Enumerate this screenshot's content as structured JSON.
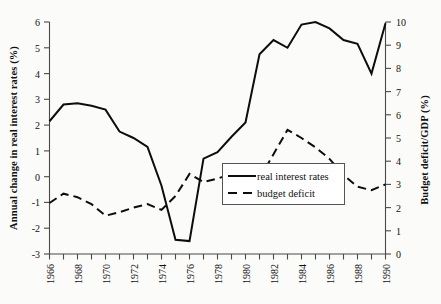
{
  "chart_data": {
    "type": "line",
    "title": "",
    "xlabel": "",
    "ylabel": "Annual change in real interest rates (%)",
    "y2label": "Budget deficit/GDP (%)",
    "grid": false,
    "legend_position": "center-right",
    "xlim": [
      1966,
      1990
    ],
    "ylim": [
      -3,
      6
    ],
    "y2lim": [
      0,
      10
    ],
    "x": [
      1966,
      1967,
      1968,
      1969,
      1970,
      1971,
      1972,
      1973,
      1974,
      1975,
      1976,
      1977,
      1978,
      1979,
      1980,
      1981,
      1982,
      1983,
      1984,
      1985,
      1986,
      1987,
      1988,
      1989,
      1990
    ],
    "xtick_labels": [
      "1966",
      "1968",
      "1970",
      "1972",
      "1974",
      "1976",
      "1978",
      "1980",
      "1982",
      "1984",
      "1986",
      "1988",
      "1990"
    ],
    "ytick_labels": [
      "-3",
      "-2",
      "-1",
      "0",
      "1",
      "2",
      "3",
      "4",
      "5",
      "6"
    ],
    "y2tick_labels": [
      "0",
      "1",
      "2",
      "3",
      "4",
      "5",
      "6",
      "7",
      "8",
      "9",
      "10"
    ],
    "series": [
      {
        "name": "real interest rates",
        "axis": "left",
        "style": "solid",
        "color": "#0d0d0d",
        "values": [
          2.15,
          2.8,
          2.85,
          2.75,
          2.6,
          1.75,
          1.5,
          1.15,
          -0.35,
          -2.45,
          -2.5,
          0.7,
          0.95,
          1.55,
          2.1,
          4.75,
          5.3,
          5.0,
          5.9,
          6.0,
          5.75,
          5.3,
          5.15,
          4.0,
          5.95
        ]
      },
      {
        "name": "budget deficit",
        "axis": "right",
        "style": "dashed",
        "color": "#0d0d0d",
        "values": [
          2.2,
          2.6,
          2.45,
          2.15,
          1.65,
          1.8,
          2.0,
          2.15,
          1.9,
          2.5,
          3.45,
          3.1,
          3.25,
          3.45,
          3.5,
          3.25,
          4.3,
          5.35,
          5.0,
          4.6,
          4.1,
          3.4,
          2.9,
          2.75,
          3.0
        ]
      }
    ],
    "legend": [
      {
        "label": "real interest rates",
        "style": "solid"
      },
      {
        "label": "budget deficit",
        "style": "dashed"
      }
    ]
  },
  "axes": {
    "left_title": "Annual change in real interest rates (%)",
    "right_title": "Budget deficit/GDP (%)"
  }
}
